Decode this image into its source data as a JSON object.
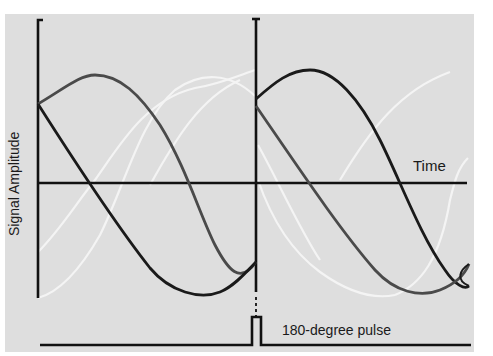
{
  "diagram": {
    "type": "spin-echo signal diagram",
    "y_axis_label": "Signal Amplitude",
    "x_axis_label": "Time",
    "pulse_label": "180-degree pulse",
    "colors": {
      "background": "#dedede",
      "page": "#ffffff",
      "curve_dark": "#1a1a1a",
      "curve_gray": "#4a4a4a",
      "curve_light": "#f2f2f2",
      "axis": "#111111"
    },
    "segments": [
      {
        "name": "before-pulse",
        "curves": [
          "dark-decay",
          "gray-sine",
          "light-sine-1",
          "light-sine-2"
        ]
      },
      {
        "name": "after-pulse",
        "curves": [
          "dark-decay",
          "dark-sine",
          "light-sine-1",
          "light-sine-2"
        ]
      }
    ]
  }
}
